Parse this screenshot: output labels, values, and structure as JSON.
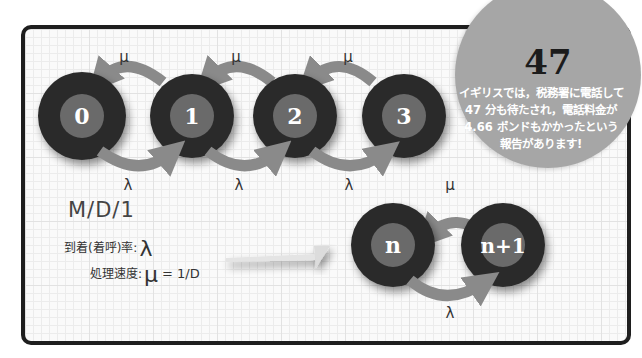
{
  "diagram": {
    "title": "M/D/1",
    "nodes": [
      {
        "label": "0"
      },
      {
        "label": "1"
      },
      {
        "label": "2"
      },
      {
        "label": "3"
      },
      {
        "label": "n"
      },
      {
        "label": "n+1"
      }
    ],
    "transitions": {
      "service_symbol": "μ",
      "arrival_symbol": "λ"
    },
    "params": {
      "arrival_rate_label": "到着(着呼)率:",
      "arrival_rate_symbol": "λ",
      "service_rate_label": "処理速度:",
      "service_rate_symbol": "μ",
      "service_rate_formula": "= 1/D"
    },
    "colors": {
      "node_outer": "#2b2b2b",
      "node_inner": "#6a6a6a",
      "arrow": "#8a8a8a",
      "badge": "#a6a6a6",
      "frame": "#1e1e1e"
    }
  },
  "callout": {
    "number": "47",
    "lines": [
      "イギリスでは，税務署に電話して",
      "47 分も待たされ，電話料金が",
      "4.66 ポンドもかかったという",
      "報告があります!"
    ]
  }
}
